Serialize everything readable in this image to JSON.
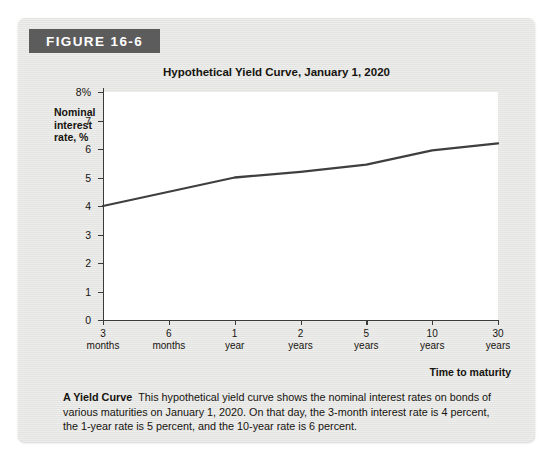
{
  "figure": {
    "banner_label": "FIGURE 16-6",
    "banner_color": "#5d5c5c",
    "card_background": "#e6e6e4"
  },
  "caption": {
    "lead": "A Yield Curve",
    "body": "This hypothetical yield curve shows the nominal interest rates on bonds of various maturities on January 1, 2020. On that day, the 3-month interest rate is 4 percent, the 1-year rate is 5 percent, and the 10-year rate is 6 percent."
  },
  "chart_data": {
    "type": "line",
    "title": "Hypothetical Yield Curve, January 1, 2020",
    "xlabel": "Time to maturity",
    "ylabel": "Nominal interest rate, %",
    "ylabel_lines": [
      "Nominal",
      "interest",
      "rate, %"
    ],
    "categories": [
      "3 months",
      "6 months",
      "1 year",
      "2 years",
      "5 years",
      "10 years",
      "30 years"
    ],
    "category_lines": [
      [
        "3",
        "months"
      ],
      [
        "6",
        "months"
      ],
      [
        "1",
        "year"
      ],
      [
        "2",
        "years"
      ],
      [
        "5",
        "years"
      ],
      [
        "10",
        "years"
      ],
      [
        "30",
        "years"
      ]
    ],
    "values": [
      4.0,
      4.5,
      5.0,
      5.2,
      5.45,
      5.95,
      6.2
    ],
    "ylim": [
      0,
      8
    ],
    "yticks": [
      0,
      1,
      2,
      3,
      4,
      5,
      6,
      7,
      8
    ],
    "ytick_labels": [
      "0",
      "1",
      "2",
      "3",
      "4",
      "5",
      "6",
      "7",
      "8%"
    ],
    "grid": false,
    "legend": "none",
    "line_color": "#3f3f3f",
    "plot_background": "#ffffff"
  }
}
